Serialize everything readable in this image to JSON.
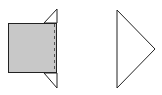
{
  "diagram": {
    "colors": {
      "background": "#ffffff",
      "square_fill": "#c8c8c8",
      "stroke": "#222222"
    },
    "shapes": [
      {
        "id": "square",
        "type": "rect",
        "x": 8,
        "y": 23,
        "w": 49,
        "h": 50,
        "fill": "gray"
      },
      {
        "id": "top-flap",
        "type": "triangle",
        "points": [
          [
            44,
            23
          ],
          [
            57,
            9
          ],
          [
            57,
            23
          ]
        ]
      },
      {
        "id": "bottom-flap",
        "type": "triangle",
        "points": [
          [
            44,
            73
          ],
          [
            57,
            88
          ],
          [
            57,
            73
          ]
        ]
      },
      {
        "id": "fold-line",
        "type": "dashed-line",
        "x": 55,
        "y1": 23,
        "y2": 73
      },
      {
        "id": "right-triangle",
        "type": "triangle",
        "points": [
          [
            117,
            10
          ],
          [
            155,
            49
          ],
          [
            117,
            88
          ]
        ]
      }
    ]
  }
}
